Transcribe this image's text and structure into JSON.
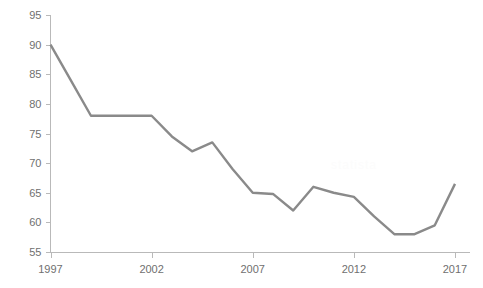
{
  "chart_data": {
    "type": "line",
    "title": "",
    "subtitle": "",
    "xlabel": "",
    "ylabel": "",
    "grid": false,
    "legend": "none",
    "xlim": [
      1997,
      2017
    ],
    "ylim": [
      55,
      95
    ],
    "x_ticks": [
      "1997",
      "2002",
      "2007",
      "2012",
      "2017"
    ],
    "y_ticks": [
      "55",
      "60",
      "65",
      "70",
      "75",
      "80",
      "85",
      "90",
      "95"
    ],
    "x": [
      1997,
      1998,
      1999,
      2000,
      2001,
      2002,
      2003,
      2004,
      2005,
      2006,
      2007,
      2008,
      2009,
      2010,
      2011,
      2012,
      2013,
      2014,
      2015,
      2016,
      2017
    ],
    "series": [
      {
        "name": "value",
        "color": "#8a8a8a",
        "values": [
          90.0,
          84.0,
          78.0,
          78.0,
          78.0,
          78.0,
          74.5,
          72.0,
          73.5,
          69.0,
          65.0,
          64.8,
          62.0,
          66.0,
          65.0,
          64.3,
          61.0,
          58.0,
          58.0,
          59.5,
          66.5
        ]
      }
    ]
  },
  "axes": {
    "y_axis_color": "#b9b9b9",
    "x_axis_color": "#b9b9b9",
    "tick_label_color": "#6f6f6f"
  },
  "watermark": {
    "text": "statista"
  }
}
